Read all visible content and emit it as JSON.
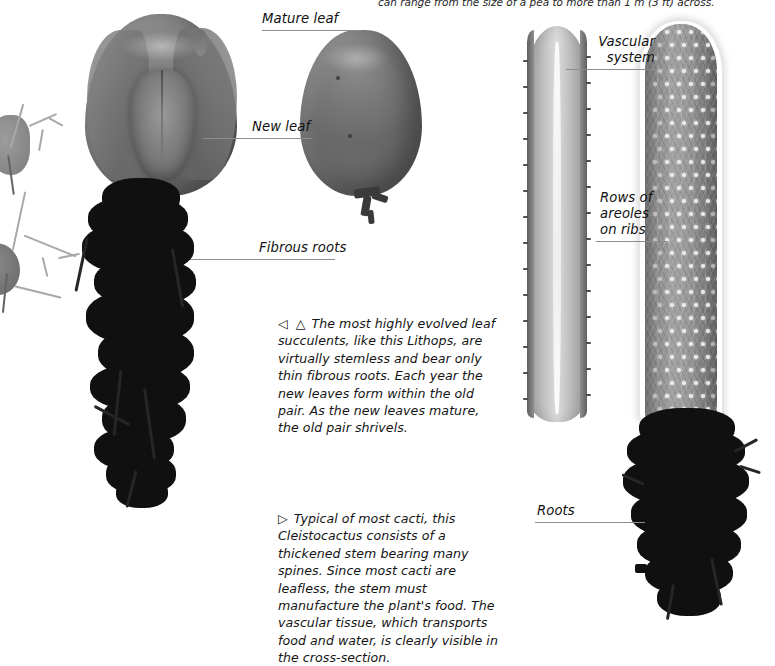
{
  "page": {
    "top_note": "can range from the size of a pea to more than 1 m (3 ft) across."
  },
  "labels": {
    "mature_leaf": "Mature leaf",
    "new_leaf": "New leaf",
    "fibrous_roots": "Fibrous roots",
    "vascular_system_line1": "Vascular",
    "vascular_system_line2": "system",
    "areoles_line1": "Rows of",
    "areoles_line2": "areoles",
    "areoles_line3": "on ribs",
    "roots": "Roots"
  },
  "captions": {
    "lithops": {
      "markers": "◁ △",
      "text": "The most highly evolved leaf succulents, like this Lithops, are virtually stemless and bear only thin fibrous roots. Each year the new leaves form within the old pair. As the new leaves mature, the old pair shrivels.",
      "taxon": "Lithops"
    },
    "cactus": {
      "markers": "▷",
      "text": "Typical of most cacti, this Cleistocactus consists of a thickened stem bearing many spines. Since most cacti are leafless, the stem must manufacture the plant's food. The vascular tissue, which transports food and water,  is clearly visible in the cross-section.",
      "taxon": "Cleistocactus"
    }
  },
  "colors": {
    "background": "#ffffff",
    "text": "#141414",
    "leader_line": "#8d8d8d",
    "root_dark": "#101010",
    "specimen_mid": "#7b7b7b"
  }
}
